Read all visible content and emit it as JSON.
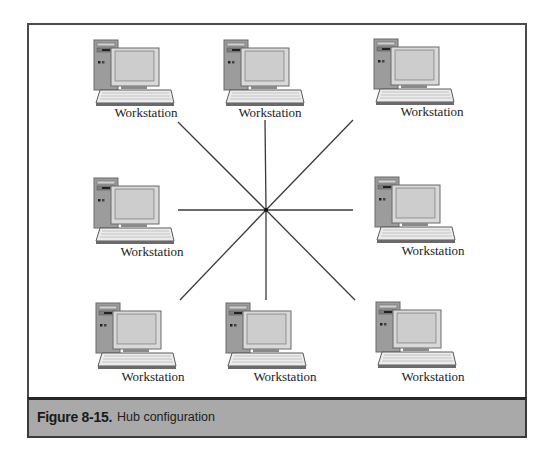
{
  "figure": {
    "number": "Figure 8-15.",
    "title": "Hub configuration"
  },
  "hub": {
    "center": [
      266,
      210
    ],
    "spokes": [
      {
        "dir": "nw",
        "to": [
          178,
          122
        ]
      },
      {
        "dir": "n",
        "to": [
          265,
          120
        ]
      },
      {
        "dir": "ne",
        "to": [
          353,
          120
        ]
      },
      {
        "dir": "w",
        "to": [
          178,
          210
        ]
      },
      {
        "dir": "e",
        "to": [
          353,
          210
        ]
      },
      {
        "dir": "sw",
        "to": [
          180,
          300
        ]
      },
      {
        "dir": "s",
        "to": [
          266,
          300
        ]
      },
      {
        "dir": "se",
        "to": [
          355,
          300
        ]
      }
    ]
  },
  "workstations": [
    {
      "label": "Workstation",
      "position": "top-left"
    },
    {
      "label": "Workstation",
      "position": "top-center"
    },
    {
      "label": "Workstation",
      "position": "top-right"
    },
    {
      "label": "Workstation",
      "position": "middle-left"
    },
    {
      "label": "Workstation",
      "position": "middle-right"
    },
    {
      "label": "Workstation",
      "position": "bottom-left"
    },
    {
      "label": "Workstation",
      "position": "bottom-center"
    },
    {
      "label": "Workstation",
      "position": "bottom-right"
    }
  ],
  "colors": {
    "frame_border": "#4a4a4a",
    "caption_fill": "#a9a9a9",
    "line": "#3a3a3a"
  }
}
